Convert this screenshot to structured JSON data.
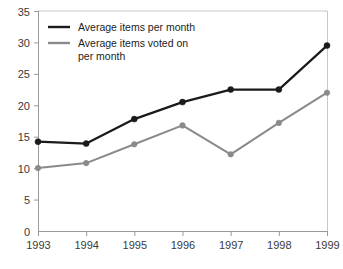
{
  "chart_data": {
    "type": "line",
    "title": "",
    "xlabel": "",
    "ylabel": "",
    "categories": [
      "1993",
      "1994",
      "1995",
      "1996",
      "1997",
      "1998",
      "1999"
    ],
    "x": [
      1993,
      1994,
      1995,
      1996,
      1997,
      1998,
      1999
    ],
    "xlim": [
      1993,
      1999
    ],
    "ylim": [
      0,
      35
    ],
    "yticks": [
      0,
      5,
      10,
      15,
      20,
      25,
      30,
      35
    ],
    "ytick_labels": [
      "0",
      "5",
      "10",
      "15",
      "20",
      "25",
      "30",
      "35"
    ],
    "grid": false,
    "legend_position": "top-left",
    "series": [
      {
        "name": "Average items per month",
        "color": "#1a1a1a",
        "marker": "circle",
        "values": [
          14.2,
          13.9,
          17.8,
          20.5,
          22.5,
          22.5,
          29.5
        ]
      },
      {
        "name": "Average items voted on per month",
        "color": "#8a8a8a",
        "marker": "circle",
        "values": [
          10.0,
          10.8,
          13.8,
          16.8,
          12.2,
          17.2,
          22.0
        ]
      }
    ]
  },
  "legend": {
    "entries": [
      {
        "label": "Average items per month",
        "label_line2": ""
      },
      {
        "label": "Average items voted on",
        "label_line2": "per month"
      }
    ]
  },
  "colors": {
    "series_dark": "#1a1a1a",
    "series_gray": "#8a8a8a",
    "axis": "#9a9a9a",
    "frame": "#c8c8c8",
    "text": "#3a3a3a",
    "background": "#ffffff"
  }
}
